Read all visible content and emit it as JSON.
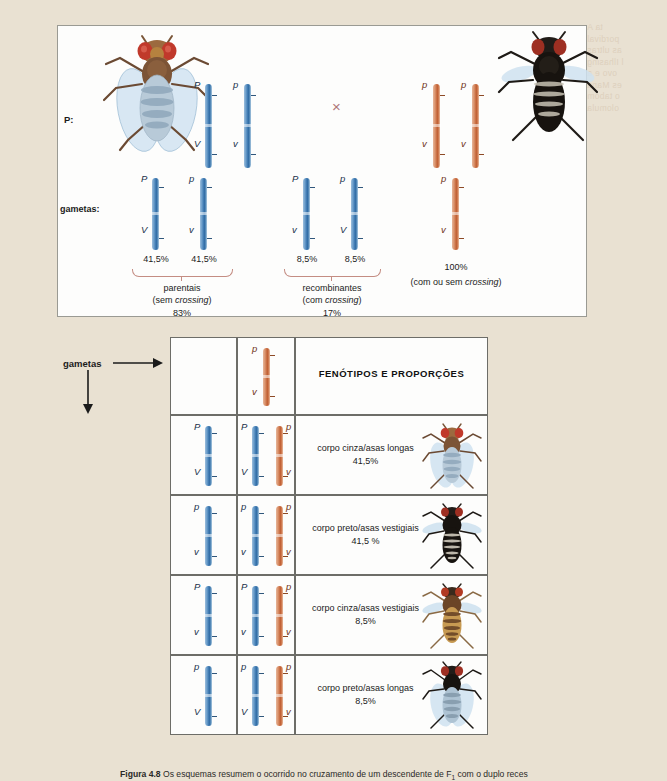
{
  "page": {
    "background_color": "#e9e1d2",
    "bleed_text": [
      "ta A",
      "pordival",
      "as ultras",
      "l Ilhasing",
      "ovo e a",
      "es Mana",
      "o tabom",
      "olomula"
    ]
  },
  "top_panel": {
    "label_P": "P:",
    "label_gametas": "gametas:",
    "cross_symbol": "×",
    "left_parent": {
      "fly_name": "gray-body-long-wings-fly",
      "chromosome_color": "#2f6ba5",
      "chromosomes": [
        {
          "top_allele": "P",
          "bottom_allele": "V"
        },
        {
          "top_allele": "p",
          "bottom_allele": "v"
        }
      ]
    },
    "right_parent": {
      "fly_name": "black-body-vestigial-wings-fly",
      "chromosome_color": "#c05f33",
      "chromosomes": [
        {
          "top_allele": "p",
          "bottom_allele": "v"
        },
        {
          "top_allele": "p",
          "bottom_allele": "v"
        }
      ]
    },
    "left_gametes": {
      "chromosomes": [
        {
          "top_allele": "P",
          "bottom_allele": "V",
          "percent": "41,5%"
        },
        {
          "top_allele": "p",
          "bottom_allele": "v",
          "percent": "41,5%"
        },
        {
          "top_allele": "P",
          "bottom_allele": "v",
          "percent": "8,5%"
        },
        {
          "top_allele": "p",
          "bottom_allele": "V",
          "percent": "8,5%"
        }
      ],
      "group_parentais": {
        "name": "parentais",
        "note": "(sem crossing)",
        "note_plain": "(sem ",
        "note_italic": "crossing",
        "note_end": ")",
        "total": "83%"
      },
      "group_recombinantes": {
        "name": "recombinantes",
        "note_plain": "(com ",
        "note_italic": "crossing",
        "note_end": ")",
        "total": "17%"
      }
    },
    "right_gametes": {
      "chromosome": {
        "top_allele": "p",
        "bottom_allele": "v"
      },
      "percent": "100%",
      "note_plain": "(com ou sem ",
      "note_italic": "crossing",
      "note_end": ")"
    }
  },
  "punnett": {
    "gametas_label": "gametas",
    "header_title": "FENÓTIPOS E PROPORÇÕES",
    "header_gamete": {
      "top_allele": "p",
      "bottom_allele": "v",
      "color": "orange"
    },
    "rows": [
      {
        "row_gamete": {
          "top_allele": "P",
          "bottom_allele": "V",
          "color": "blue"
        },
        "zygote": [
          {
            "top_allele": "P",
            "bottom_allele": "V",
            "color": "blue"
          },
          {
            "top_allele": "p",
            "bottom_allele": "v",
            "color": "orange"
          }
        ],
        "phenotype": "corpo cinza/asas longas",
        "proportion": "41,5%",
        "fly_name": "gray-body-long-wings-fly"
      },
      {
        "row_gamete": {
          "top_allele": "p",
          "bottom_allele": "v",
          "color": "blue"
        },
        "zygote": [
          {
            "top_allele": "p",
            "bottom_allele": "v",
            "color": "blue"
          },
          {
            "top_allele": "p",
            "bottom_allele": "v",
            "color": "orange"
          }
        ],
        "phenotype": "corpo preto/asas vestigiais",
        "proportion": "41,5 %",
        "fly_name": "black-body-vestigial-wings-fly"
      },
      {
        "row_gamete": {
          "top_allele": "P",
          "bottom_allele": "v",
          "color": "blue"
        },
        "zygote": [
          {
            "top_allele": "P",
            "bottom_allele": "v",
            "color": "blue"
          },
          {
            "top_allele": "p",
            "bottom_allele": "v",
            "color": "orange"
          }
        ],
        "phenotype": "corpo cinza/asas vestigiais",
        "proportion": "8,5%",
        "fly_name": "gray-body-vestigial-wings-fly"
      },
      {
        "row_gamete": {
          "top_allele": "p",
          "bottom_allele": "V",
          "color": "blue"
        },
        "zygote": [
          {
            "top_allele": "p",
            "bottom_allele": "V",
            "color": "blue"
          },
          {
            "top_allele": "p",
            "bottom_allele": "v",
            "color": "orange"
          }
        ],
        "phenotype": "corpo preto/asas longas",
        "proportion": "8,5%",
        "fly_name": "black-body-long-wings-fly"
      }
    ]
  },
  "caption": {
    "figure_number": "Figura 4.8",
    "text": "Os esquemas resumem o ocorrido no cruzamento de um descendente de F",
    "subscript": "1",
    "text_end": " com o duplo reces"
  }
}
